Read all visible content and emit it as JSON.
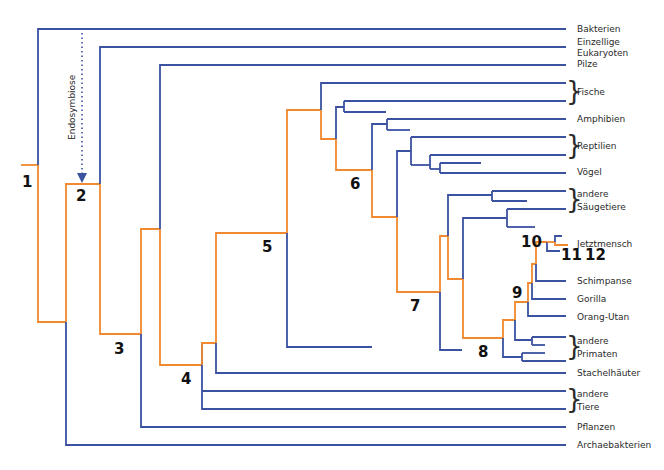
{
  "diagram": {
    "type": "phylogenetic-tree",
    "colors": {
      "lineage": "#f0892f",
      "branch": "#3a52a0",
      "text": "#2a2a2a"
    },
    "annotation": {
      "label": "Endosymbiose",
      "icon": "dotted-arrow-down"
    },
    "leaves": [
      {
        "id": "bakterien",
        "label": "Bakterien"
      },
      {
        "id": "eukaryoten",
        "label": "Einzellige Eukaryoten",
        "lines": [
          "Einzellige",
          "Eukaryoten"
        ]
      },
      {
        "id": "pilze",
        "label": "Pilze"
      },
      {
        "id": "fische",
        "label": "Fische",
        "group": true
      },
      {
        "id": "amphibien",
        "label": "Amphibien"
      },
      {
        "id": "reptilien",
        "label": "Reptilien",
        "group": true
      },
      {
        "id": "voegel",
        "label": "Vögel"
      },
      {
        "id": "saeugetiere",
        "label": "andere Säugetiere",
        "lines": [
          "andere",
          "Säugetiere"
        ],
        "group": true
      },
      {
        "id": "jetztmensch",
        "label": "Jetztmensch"
      },
      {
        "id": "schimpanse",
        "label": "Schimpanse"
      },
      {
        "id": "gorilla",
        "label": "Gorilla"
      },
      {
        "id": "orangutan",
        "label": "Orang-Utan"
      },
      {
        "id": "primaten",
        "label": "andere Primaten",
        "lines": [
          "andere",
          "Primaten"
        ],
        "group": true
      },
      {
        "id": "stachelhaeuter",
        "label": "Stachelhäuter"
      },
      {
        "id": "tiere",
        "label": "andere Tiere",
        "lines": [
          "andere",
          "Tiere"
        ],
        "group": true
      },
      {
        "id": "pflanzen",
        "label": "Pflanzen"
      },
      {
        "id": "archaebakterien",
        "label": "Archaebakterien"
      }
    ],
    "nodes": [
      "1",
      "2",
      "3",
      "4",
      "5",
      "6",
      "7",
      "8",
      "9",
      "10",
      "11",
      "12"
    ]
  }
}
